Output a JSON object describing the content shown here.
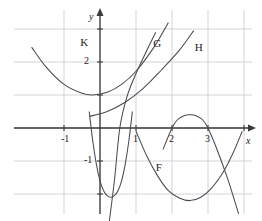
{
  "figure": {
    "background_color": "#ffffff",
    "grid_color": "#c9c9cf",
    "axis_color": "#3a3a3a",
    "curve_color": "#4a4a52",
    "width": 262,
    "height": 221
  },
  "chart_data": {
    "type": "line",
    "title": "",
    "xlabel": "x",
    "ylabel": "y",
    "grid": true,
    "legend": "inline-labels",
    "xlim": [
      -1.9,
      4.0
    ],
    "ylim": [
      -2.9,
      3.3
    ],
    "xticks": [
      -1,
      1,
      2,
      3
    ],
    "xtick_labels": [
      "-1",
      "1",
      "2",
      "3"
    ],
    "yticks": [
      2,
      -1
    ],
    "ytick_labels": [
      "2",
      "-1"
    ],
    "grid_spacing": {
      "x": 1,
      "y": 1
    },
    "annotations": [
      {
        "label": "K",
        "x": -0.55,
        "y": 2.75
      },
      {
        "label": "G",
        "x": 1.48,
        "y": 2.72
      },
      {
        "label": "H",
        "x": 2.63,
        "y": 2.6
      },
      {
        "label": "F",
        "x": 1.55,
        "y": -1.02
      }
    ],
    "series": [
      {
        "name": "K",
        "label": "K",
        "kind": "parabola",
        "description": "steep narrow upward parabola, vertex near (0.3, -2.1)",
        "vertex": [
          0.3,
          -2.1
        ],
        "a": 6.0,
        "points": [
          [
            -0.3,
            0.5
          ],
          [
            -0.2,
            -0.4
          ],
          [
            -0.1,
            -1.1
          ],
          [
            0.0,
            -1.6
          ],
          [
            0.1,
            -1.9
          ],
          [
            0.2,
            -2.05
          ],
          [
            0.3,
            -2.1
          ],
          [
            0.4,
            -2.05
          ],
          [
            0.5,
            -1.9
          ],
          [
            0.6,
            -1.6
          ],
          [
            0.7,
            -1.1
          ],
          [
            0.8,
            -0.4
          ],
          [
            0.9,
            0.5
          ]
        ]
      },
      {
        "name": "wide-parabola",
        "label": "",
        "kind": "parabola",
        "description": "wide upward parabola, vertex near (-0.2, 1.0)",
        "vertex": [
          -0.2,
          1.0
        ],
        "a": 0.5,
        "points": [
          [
            -1.9,
            2.45
          ],
          [
            -1.5,
            1.85
          ],
          [
            -1.0,
            1.32
          ],
          [
            -0.5,
            1.05
          ],
          [
            -0.2,
            1.0
          ],
          [
            0.2,
            1.08
          ],
          [
            0.6,
            1.32
          ],
          [
            1.0,
            1.72
          ],
          [
            1.5,
            2.45
          ],
          [
            1.9,
            3.2
          ]
        ]
      },
      {
        "name": "G",
        "label": "G",
        "kind": "curve",
        "description": "steep rising curve crossing x-axis near x=0.55",
        "points": [
          [
            0.25,
            -2.9
          ],
          [
            0.4,
            -1.6
          ],
          [
            0.55,
            0.0
          ],
          [
            0.75,
            0.95
          ],
          [
            1.0,
            1.65
          ],
          [
            1.3,
            2.35
          ],
          [
            1.55,
            2.9
          ]
        ]
      },
      {
        "name": "H",
        "label": "H",
        "kind": "curve",
        "description": "gentle rising curve, shallow at left, steeper at right",
        "points": [
          [
            -0.3,
            0.35
          ],
          [
            0.2,
            0.5
          ],
          [
            0.7,
            0.78
          ],
          [
            1.2,
            1.2
          ],
          [
            1.7,
            1.75
          ],
          [
            2.2,
            2.35
          ],
          [
            2.6,
            2.95
          ]
        ]
      },
      {
        "name": "F",
        "label": "F",
        "kind": "parabola",
        "description": "upward parabola, vertex near (2.5, -2.2), rising through x-axis",
        "vertex": [
          2.5,
          -2.2
        ],
        "a": 1.0,
        "points": [
          [
            1.0,
            -0.1
          ],
          [
            1.3,
            -0.85
          ],
          [
            1.6,
            -1.45
          ],
          [
            1.9,
            -1.9
          ],
          [
            2.2,
            -2.12
          ],
          [
            2.5,
            -2.2
          ],
          [
            2.8,
            -2.1
          ],
          [
            3.1,
            -1.82
          ],
          [
            3.4,
            -1.38
          ],
          [
            3.7,
            -0.75
          ],
          [
            3.95,
            -0.1
          ]
        ]
      },
      {
        "name": "downward-parabola",
        "label": "",
        "kind": "parabola",
        "description": "downward parabola with roots at x=2 and x=3, vertex near (2.5, 0.4)",
        "vertex": [
          2.5,
          0.4
        ],
        "roots": [
          2,
          3
        ],
        "a": -1.6,
        "points": [
          [
            1.75,
            -0.65
          ],
          [
            2.0,
            0.0
          ],
          [
            2.15,
            0.25
          ],
          [
            2.35,
            0.38
          ],
          [
            2.5,
            0.4
          ],
          [
            2.65,
            0.38
          ],
          [
            2.85,
            0.25
          ],
          [
            3.0,
            0.0
          ],
          [
            3.25,
            -0.65
          ],
          [
            3.55,
            -1.55
          ],
          [
            3.85,
            -2.6
          ]
        ]
      }
    ]
  }
}
